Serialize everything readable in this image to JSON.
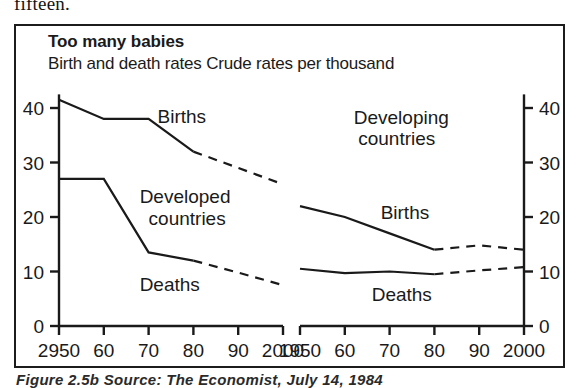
{
  "page": {
    "body_text_fragment": "fifteen."
  },
  "figure": {
    "title": "Too many babies",
    "subtitle": "Birth and death rates Crude rates per thousand",
    "caption": "Figure 2.5b   Source: The Economist, July 14, 1984",
    "border_color": "#1c1c1c",
    "line_color": "#1a1a1a"
  },
  "chart_data": {
    "type": "line",
    "title": "Too many babies",
    "subtitle": "Birth and death rates Crude rates per thousand",
    "ylabel": "Crude rates per thousand",
    "xlabel": "",
    "ylim": [
      0,
      45
    ],
    "yticks": [
      0,
      10,
      20,
      30,
      40
    ],
    "grid": false,
    "legend": "inline-labels",
    "panels": [
      {
        "name": "developed-countries",
        "panel_label": "Developed countries",
        "panel_label_lines": [
          "Developed",
          "countries"
        ],
        "xlim": [
          1950,
          2000
        ],
        "x": [
          1950,
          1960,
          1970,
          1980,
          1990,
          2000
        ],
        "xtick_labels": [
          "2950",
          "60",
          "70",
          "80",
          "90",
          "2000"
        ],
        "ytick_labels": [
          "40",
          "30",
          "20",
          "10",
          "0"
        ],
        "y_axis_side": "left",
        "series": [
          {
            "name": "Births",
            "label": "Births",
            "solid_x": [
              1950,
              1960,
              1970,
              1980
            ],
            "solid_values": [
              41.5,
              38.0,
              38.0,
              32.0
            ],
            "dashed_x": [
              1980,
              1990,
              2000
            ],
            "dashed_values": [
              32.0,
              29.0,
              26.0
            ]
          },
          {
            "name": "Deaths",
            "label": "Deaths",
            "solid_x": [
              1950,
              1960,
              1970,
              1980
            ],
            "solid_values": [
              27.0,
              27.0,
              13.5,
              12.0
            ],
            "dashed_x": [
              1980,
              1990,
              2000
            ],
            "dashed_values": [
              12.0,
              9.8,
              7.5
            ]
          }
        ]
      },
      {
        "name": "developing-countries",
        "panel_label": "Developing countries",
        "panel_label_lines": [
          "Developing",
          "countries"
        ],
        "xlim": [
          1950,
          2000
        ],
        "x": [
          1950,
          1960,
          1970,
          1980,
          1990,
          2000
        ],
        "xtick_labels": [
          "1950",
          "60",
          "70",
          "80",
          "90",
          "2000"
        ],
        "ytick_labels": [
          "40",
          "30",
          "20",
          "10",
          "0"
        ],
        "y_axis_side": "right",
        "series": [
          {
            "name": "Births",
            "label": "Births",
            "solid_x": [
              1950,
              1960,
              1970,
              1980
            ],
            "solid_values": [
              22.0,
              20.0,
              17.0,
              14.0
            ],
            "dashed_x": [
              1980,
              1990,
              2000
            ],
            "dashed_values": [
              14.0,
              14.8,
              14.0
            ]
          },
          {
            "name": "Deaths",
            "label": "Deaths",
            "solid_x": [
              1950,
              1960,
              1970,
              1980
            ],
            "solid_values": [
              10.5,
              9.7,
              10.0,
              9.5
            ],
            "dashed_x": [
              1980,
              1990,
              2000
            ],
            "dashed_values": [
              9.5,
              10.2,
              10.8
            ]
          }
        ]
      }
    ]
  }
}
